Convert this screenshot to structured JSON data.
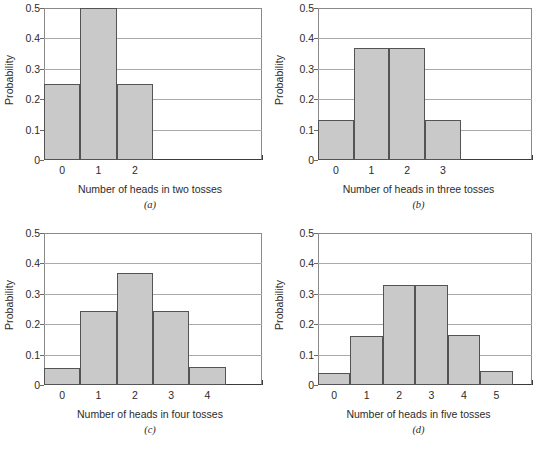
{
  "figure": {
    "y_axis_title": "Probability",
    "y_ticks": [
      "0",
      "0.1",
      "0.2",
      "0.3",
      "0.4",
      "0.5"
    ],
    "bar_fill_color": "#c9c9c9",
    "bar_border_color": "#545454",
    "gridline_color": "#a9a9a9",
    "axis_color": "#3a3a3a",
    "background_color": "#ffffff"
  },
  "chart_data": [
    {
      "type": "bar",
      "panel": "a",
      "caption": "(a)",
      "title": "",
      "xlabel": "Number of heads in two tosses",
      "ylabel": "Probability",
      "categories": [
        "0",
        "1",
        "2"
      ],
      "values": [
        0.25,
        0.5,
        0.25
      ],
      "x_slots": 6,
      "ylim": [
        0,
        0.5
      ],
      "yticks": [
        0,
        0.1,
        0.2,
        0.3,
        0.4,
        0.5
      ],
      "grid": true,
      "legend": "none"
    },
    {
      "type": "bar",
      "panel": "b",
      "caption": "(b)",
      "title": "",
      "xlabel": "Number of heads in three tosses",
      "ylabel": "Probability",
      "categories": [
        "0",
        "1",
        "2",
        "3"
      ],
      "values": [
        0.13,
        0.37,
        0.37,
        0.13
      ],
      "x_slots": 6,
      "ylim": [
        0,
        0.5
      ],
      "yticks": [
        0,
        0.1,
        0.2,
        0.3,
        0.4,
        0.5
      ],
      "grid": true,
      "legend": "none"
    },
    {
      "type": "bar",
      "panel": "c",
      "caption": "(c)",
      "title": "",
      "xlabel": "Number of heads in four tosses",
      "ylabel": "Probability",
      "categories": [
        "0",
        "1",
        "2",
        "3",
        "4"
      ],
      "values": [
        0.055,
        0.245,
        0.37,
        0.245,
        0.06
      ],
      "x_slots": 6,
      "ylim": [
        0,
        0.5
      ],
      "yticks": [
        0,
        0.1,
        0.2,
        0.3,
        0.4,
        0.5
      ],
      "grid": true,
      "legend": "none"
    },
    {
      "type": "bar",
      "panel": "d",
      "caption": "(d)",
      "title": "",
      "xlabel": "Number of heads in five tosses",
      "ylabel": "Probability",
      "categories": [
        "0",
        "1",
        "2",
        "3",
        "4",
        "5"
      ],
      "values": [
        0.04,
        0.16,
        0.33,
        0.33,
        0.165,
        0.045
      ],
      "x_slots": 6.6,
      "ylim": [
        0,
        0.5
      ],
      "yticks": [
        0,
        0.1,
        0.2,
        0.3,
        0.4,
        0.5
      ],
      "grid": true,
      "legend": "none"
    }
  ]
}
